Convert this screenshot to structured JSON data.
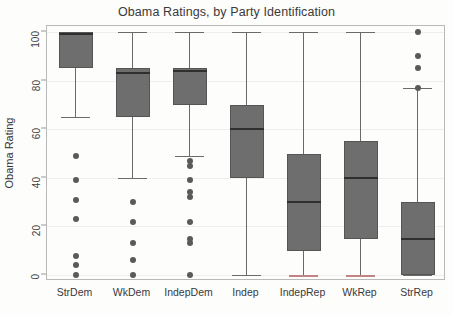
{
  "chart_data": {
    "type": "box",
    "title": "Obama Ratings, by Party Identification",
    "xlabel": "",
    "ylabel": "Obama Rating",
    "ylim": [
      0,
      100
    ],
    "yticks": [
      0,
      20,
      40,
      60,
      80,
      100
    ],
    "grid": true,
    "legend": "none",
    "categories": [
      "StrDem",
      "WkDem",
      "IndepDem",
      "Indep",
      "IndepRep",
      "WkRep",
      "StrRep"
    ],
    "boxes": [
      {
        "category": "StrDem",
        "whisker_low": 65,
        "q1": 85,
        "median": 99,
        "q3": 100,
        "whisker_high": 100,
        "cap_low_color": "#6a6a6a",
        "outliers": [
          49,
          39,
          31,
          23,
          8,
          4,
          0
        ]
      },
      {
        "category": "WkDem",
        "whisker_low": 40,
        "q1": 65,
        "median": 83,
        "q3": 85,
        "whisker_high": 100,
        "cap_low_color": "#6a6a6a",
        "outliers": [
          30,
          22,
          13,
          6,
          0
        ]
      },
      {
        "category": "IndepDem",
        "whisker_low": 49,
        "q1": 70,
        "median": 84,
        "q3": 85,
        "whisker_high": 100,
        "cap_low_color": "#6a6a6a",
        "outliers": [
          47,
          45,
          39,
          34,
          32,
          22,
          15,
          13,
          0
        ]
      },
      {
        "category": "Indep",
        "whisker_low": 0,
        "q1": 40,
        "median": 60,
        "q3": 70,
        "whisker_high": 100,
        "cap_low_color": "#6a6a6a",
        "outliers": []
      },
      {
        "category": "IndepRep",
        "whisker_low": 0,
        "q1": 10,
        "median": 30,
        "q3": 50,
        "whisker_high": 100,
        "cap_low_color": "#c08484",
        "outliers": []
      },
      {
        "category": "WkRep",
        "whisker_low": 0,
        "q1": 15,
        "median": 40,
        "q3": 55,
        "whisker_high": 100,
        "cap_low_color": "#c08484",
        "outliers": []
      },
      {
        "category": "StrRep",
        "whisker_low": 0,
        "q1": 0,
        "median": 15,
        "q3": 30,
        "whisker_high": 77,
        "cap_low_color": "#6a6a6a",
        "outliers": [
          100,
          90,
          85,
          77
        ]
      }
    ]
  },
  "style": {
    "box_fill": "#6e6e6e",
    "median_color": "#2f2f2f",
    "whisker_color": "#6a6a6a",
    "outlier_color": "#5a5a5a",
    "grid_color": "#f0eeec",
    "axis_color": "#b9b9b9",
    "text_color": "#3a3a3a",
    "background": "#fdfdfc"
  }
}
